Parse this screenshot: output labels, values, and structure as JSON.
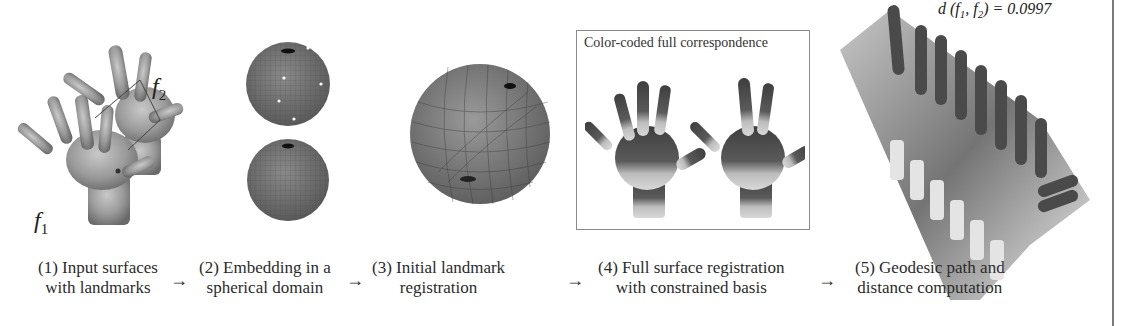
{
  "figure": {
    "steps": [
      {
        "number": "(1)",
        "line1": "(1) Input surfaces",
        "line2": "with landmarks"
      },
      {
        "number": "(2)",
        "line1": "(2) Embedding in a",
        "line2": "spherical domain"
      },
      {
        "number": "(3)",
        "line1": "(3) Initial landmark",
        "line2": "registration"
      },
      {
        "number": "(4)",
        "line1": "(4) Full surface registration",
        "line2": "with constrained basis"
      },
      {
        "number": "(5)",
        "line1": "(5) Geodesic path and",
        "line2": "distance computation"
      }
    ],
    "arrow_glyph": "→",
    "surface_labels": {
      "f1": {
        "base": "f",
        "sub": "1"
      },
      "f2": {
        "base": "f",
        "sub": "2"
      }
    },
    "correspondence_box_title": "Color-coded full correspondence",
    "distance": {
      "prefix": "d (f",
      "sub1": "1",
      "mid": ", f",
      "sub2": "2",
      "suffix": ") = 0.0997",
      "value": "0.0997"
    },
    "colors": {
      "surface_gray": "#8c8c8c",
      "sphere_gray": "#6e6e6e",
      "box_border": "#8a8a8a",
      "text": "#2b2b2b"
    }
  }
}
